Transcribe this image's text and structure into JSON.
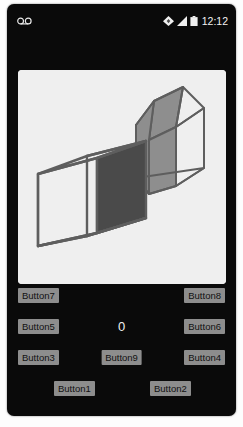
{
  "device": {
    "name": "android-phone",
    "body_color": "#0a0a0a",
    "screen_bg": "#0a0a0a"
  },
  "status_bar": {
    "left_icon": "voicemail-icon",
    "icons": [
      "wifi-icon",
      "signal-icon",
      "battery-icon"
    ],
    "clock": "12:12",
    "text_color": "#f2f2f2"
  },
  "canvas": {
    "name": "3d-shape-canvas",
    "background": "#efefef",
    "watermark": "",
    "stroke_color": "#5e5e5e",
    "shapes": [
      {
        "name": "cube",
        "type": "wireframe-cube",
        "filled_face_color": "#4a4a4a",
        "filled_face": "right"
      },
      {
        "name": "pentagonal-prism",
        "type": "wireframe-house-prism",
        "filled_face_color": "#8e8e8e",
        "filled_face": "left"
      }
    ]
  },
  "controls": {
    "counter_value": "0",
    "rows": [
      {
        "left": "Button7",
        "right": "Button8"
      },
      {
        "left": "Button5",
        "right": "Button6"
      },
      {
        "left": "Button3",
        "center": "Button9",
        "right": "Button4"
      },
      {
        "left": "Button1",
        "right": "Button2"
      }
    ],
    "button_bg": "#8d8d8d",
    "button_text_color": "#111111"
  }
}
